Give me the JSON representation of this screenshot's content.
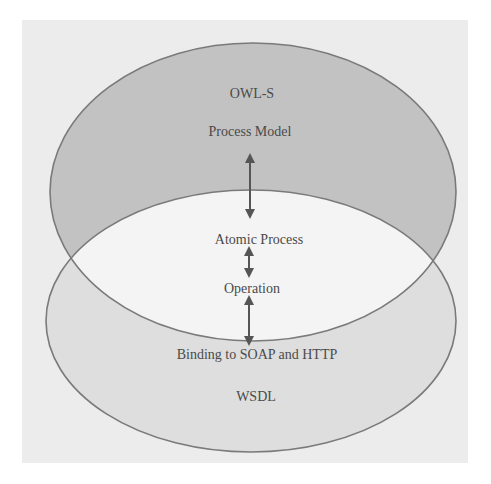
{
  "diagram": {
    "type": "overlapping-ellipses",
    "colors": {
      "page_background": "#ffffff",
      "paper_background": "#ececec",
      "upper_ellipse_fill": "#c2c2c2",
      "lower_ellipse_fill": "#dedede",
      "overlap_fill": "#f4f4f4",
      "stroke": "#7a7a7a",
      "arrow": "#555555",
      "text": "#4a4a4a"
    },
    "upper_ellipse": {
      "title": "OWL-S",
      "subtitle": "Process Model"
    },
    "overlap": {
      "top_label": "Atomic Process",
      "bottom_label": "Operation"
    },
    "lower_ellipse": {
      "subtitle": "Binding to SOAP and HTTP",
      "title": "WSDL"
    },
    "arrows": [
      {
        "from": "Process Model",
        "to": "Atomic Process",
        "direction": "bidirectional"
      },
      {
        "from": "Atomic Process",
        "to": "Operation",
        "direction": "bidirectional"
      },
      {
        "from": "Operation",
        "to": "Binding to SOAP and HTTP",
        "direction": "bidirectional"
      }
    ]
  }
}
